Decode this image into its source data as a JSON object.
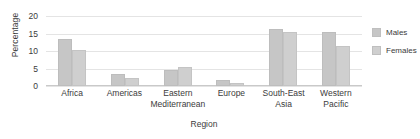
{
  "chart_data": {
    "type": "bar",
    "title": "",
    "subtitle": "",
    "xlabel": "Region",
    "ylabel": "Percentage",
    "ylim": [
      0,
      20
    ],
    "yticks": [
      0,
      5,
      10,
      15,
      20
    ],
    "grid": true,
    "legend_position": "right",
    "categories": [
      "Africa",
      "Americas",
      "Eastern Mediterranean",
      "Europe",
      "South-East Asia",
      "Western Pacific"
    ],
    "category_lines": [
      [
        "Africa"
      ],
      [
        "Americas"
      ],
      [
        "Eastern",
        "Mediterranean"
      ],
      [
        "Europe"
      ],
      [
        "South-East",
        "Asia"
      ],
      [
        "Western",
        "Pacific"
      ]
    ],
    "series": [
      {
        "name": "Males",
        "color": "#c6c6c6",
        "values": [
          13.4,
          3.5,
          4.7,
          1.8,
          16.2,
          15.3
        ]
      },
      {
        "name": "Females",
        "color": "#cfcfcf",
        "values": [
          10.3,
          2.2,
          5.5,
          1.0,
          15.5,
          11.3
        ]
      }
    ]
  },
  "legend": {
    "items": [
      {
        "label": "Males"
      },
      {
        "label": "Females"
      }
    ]
  }
}
